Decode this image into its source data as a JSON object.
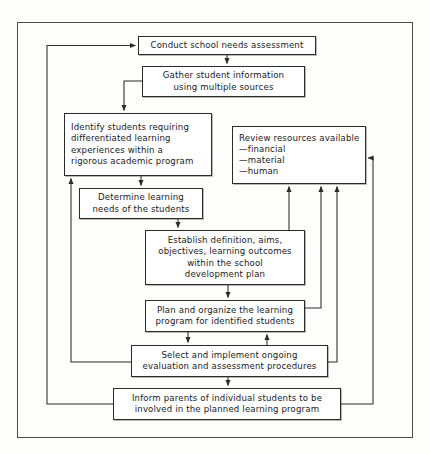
{
  "diagram": {
    "frame": {
      "name": "outer-border"
    },
    "colors": {
      "stroke": "#2b2b2b",
      "frame": "#4a4a4a",
      "background": "#fdfdfb",
      "box_fill": "#ffffff",
      "text": "#1a1a1a"
    },
    "nodes": [
      {
        "id": "conduct",
        "text": "Conduct school needs assessment",
        "x": 138,
        "y": 36,
        "w": 178,
        "h": 19
      },
      {
        "id": "gather",
        "text": "Gather student information\nusing multiple sources",
        "x": 142,
        "y": 66,
        "w": 163,
        "h": 31
      },
      {
        "id": "identify",
        "text": "Identify students requiring\ndifferentiated learning\nexperiences within a\nrigorous academic program",
        "x": 64,
        "y": 113,
        "w": 148,
        "h": 63
      },
      {
        "id": "review",
        "text": "Review resources available\n    —financial\n    —material\n    —human",
        "x": 232,
        "y": 126,
        "w": 134,
        "h": 58
      },
      {
        "id": "determine",
        "text": "Determine learning\nneeds of the students",
        "x": 79,
        "y": 188,
        "w": 124,
        "h": 31
      },
      {
        "id": "establish",
        "text": "Establish definition, aims,\nobjectives, learning outcomes\nwithin the school\ndevelopment plan",
        "x": 145,
        "y": 230,
        "w": 160,
        "h": 55
      },
      {
        "id": "plan",
        "text": "Plan and organize the learning\nprogram for identified students",
        "x": 145,
        "y": 300,
        "w": 160,
        "h": 32
      },
      {
        "id": "select",
        "text": "Select and implement ongoing\nevaluation and assessment procedures",
        "x": 131,
        "y": 345,
        "w": 197,
        "h": 32
      },
      {
        "id": "inform",
        "text": "Inform parents of individual students to be\ninvolved in the planned learning program",
        "x": 113,
        "y": 388,
        "w": 228,
        "h": 32
      }
    ],
    "connectors": [
      {
        "id": "conduct-to-gather",
        "from": "conduct",
        "to": "gather",
        "kind": "arrow-down"
      },
      {
        "id": "gather-to-identify",
        "from": "gather",
        "to": "identify",
        "kind": "elbow-arrow-down"
      },
      {
        "id": "identify-to-determine",
        "from": "identify",
        "to": "determine",
        "kind": "arrow-down"
      },
      {
        "id": "determine-to-establish",
        "from": "determine",
        "to": "establish",
        "kind": "arrow-down"
      },
      {
        "id": "establish-to-plan",
        "from": "establish",
        "to": "plan",
        "kind": "arrow-down"
      },
      {
        "id": "plan-to-select",
        "from": "plan",
        "to": "select",
        "kind": "arrow-down"
      },
      {
        "id": "select-to-plan",
        "from": "select",
        "to": "plan",
        "kind": "arrow-up"
      },
      {
        "id": "select-to-inform",
        "from": "select",
        "to": "inform",
        "kind": "arrow-down"
      },
      {
        "id": "establish-to-review",
        "from": "establish",
        "to": "review",
        "kind": "arrow-up"
      },
      {
        "id": "plan-to-review",
        "from": "plan",
        "to": "review",
        "kind": "arrow-up"
      },
      {
        "id": "select-to-review",
        "from": "select",
        "to": "review",
        "kind": "arrow-up"
      },
      {
        "id": "inform-to-review",
        "from": "inform",
        "to": "review",
        "kind": "feedback-right"
      },
      {
        "id": "select-to-identify",
        "from": "select",
        "to": "identify",
        "kind": "feedback-left"
      },
      {
        "id": "inform-to-conduct",
        "from": "inform",
        "to": "conduct",
        "kind": "feedback-left-outer"
      }
    ]
  }
}
